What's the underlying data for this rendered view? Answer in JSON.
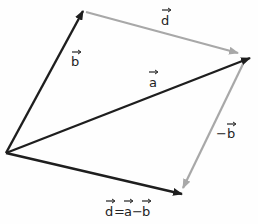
{
  "diagram": {
    "colors": {
      "primary": "#1e1e1e",
      "secondary": "#a8a8a8",
      "background": "#fefefe"
    },
    "vectors": [
      {
        "id": "b",
        "label": "b",
        "from": [
          6,
          153
        ],
        "to": [
          83,
          11
        ],
        "color": "primary"
      },
      {
        "id": "a",
        "label": "a",
        "from": [
          6,
          153
        ],
        "to": [
          250,
          58
        ],
        "color": "primary"
      },
      {
        "id": "d-result",
        "label": "d=a−b",
        "from": [
          6,
          153
        ],
        "to": [
          182,
          194
        ],
        "color": "primary"
      },
      {
        "id": "d-top",
        "label": "d",
        "from": [
          86,
          12
        ],
        "to": [
          238,
          53
        ],
        "color": "secondary"
      },
      {
        "id": "neg-b",
        "label": "−b",
        "from": [
          243,
          64
        ],
        "to": [
          183,
          188
        ],
        "color": "secondary"
      }
    ],
    "labels": {
      "b": "b",
      "a": "a",
      "d_top": "d",
      "neg_b": "−b",
      "d_eq_d": "d",
      "d_eq_eq": "=",
      "d_eq_a": "a",
      "d_eq_minus": "−",
      "d_eq_b": "b"
    }
  }
}
